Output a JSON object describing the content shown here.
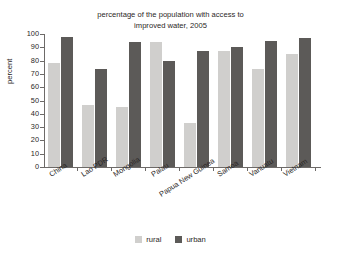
{
  "chart_data": {
    "type": "bar",
    "title": "percentage of the population with access to improved water, 2005",
    "title_line1": "percentage of the population with access to",
    "title_line2": "improved water, 2005",
    "xlabel": "",
    "ylabel": "percent",
    "ylim": [
      0,
      100
    ],
    "ytick_step": 10,
    "yticks": [
      0,
      10,
      20,
      30,
      40,
      50,
      60,
      70,
      80,
      90,
      100
    ],
    "grid": false,
    "legend_position": "bottom-center",
    "categories": [
      "China",
      "Lao PDR",
      "Mongolia",
      "Palau",
      "Papua New Guinea",
      "Samoa",
      "Vanuatu",
      "Vietnam"
    ],
    "series": [
      {
        "name": "rural",
        "color": "#d0cfcd",
        "values": [
          78,
          47,
          45,
          94,
          33,
          87,
          74,
          85
        ]
      },
      {
        "name": "urban",
        "color": "#5c5a58",
        "values": [
          98,
          74,
          94,
          80,
          87,
          90,
          95,
          97
        ]
      }
    ]
  },
  "legend": {
    "items": [
      {
        "label": "rural"
      },
      {
        "label": "urban"
      }
    ]
  }
}
